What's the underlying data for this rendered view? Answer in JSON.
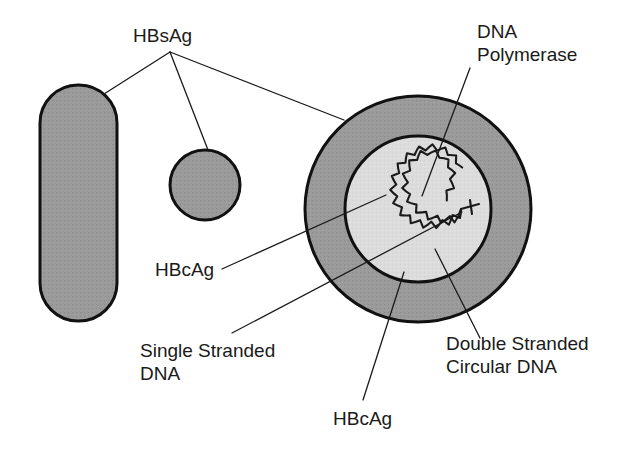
{
  "figure": {
    "background_color": "#ffffff",
    "width": 638,
    "height": 452
  },
  "colors": {
    "surface_antigen_fill": "#9a9a9a",
    "envelope_fill": "#9a9a9a",
    "core_fill": "#dcdcdc",
    "outline": "#111111",
    "leader_line": "#1a1a1a",
    "text": "#1a1a1a"
  },
  "labels": {
    "hbsag_top": "HBsAg",
    "dna_polymerase_line1": "DNA",
    "dna_polymerase_line2": "Polymerase",
    "hbcag_left": "HBcAg",
    "single_stranded_line1": "Single Stranded",
    "single_stranded_line2": "DNA",
    "hbcag_bottom": "HBcAg",
    "double_stranded_line1": "Double Stranded",
    "double_stranded_line2": "Circular DNA"
  },
  "shapes": {
    "filamentous_particle": {
      "name": "Filamentous HBsAg particle",
      "x": 40,
      "y": 85,
      "width": 77,
      "height": 236,
      "corner_radius": 38
    },
    "spherical_particle": {
      "name": "Spherical HBsAg particle",
      "cx": 205,
      "cy": 185,
      "r": 35
    },
    "virion": {
      "name": "Dane particle (complete virion)",
      "cx": 418,
      "cy": 209,
      "outer_r": 113,
      "core_r": 73,
      "dna_r": 43
    }
  },
  "annotations": [
    {
      "id": "hbsag-top",
      "text": "HBsAg",
      "points_to": [
        "filamentous-particle",
        "spherical-particle",
        "virion-envelope"
      ]
    },
    {
      "id": "dna-polymerase",
      "text": "DNA Polymerase",
      "points_to": [
        "dna-polymerase-site"
      ]
    },
    {
      "id": "hbcag-left",
      "text": "HBcAg",
      "points_to": [
        "virion-core"
      ]
    },
    {
      "id": "single-stranded-dna",
      "text": "Single Stranded DNA",
      "points_to": [
        "dna-single-strand-gap"
      ]
    },
    {
      "id": "hbcag-bottom",
      "text": "HBcAg",
      "points_to": [
        "virion-core"
      ]
    },
    {
      "id": "double-stranded-circular-dna",
      "text": "Double Stranded Circular DNA",
      "points_to": [
        "dna-circle"
      ]
    }
  ]
}
